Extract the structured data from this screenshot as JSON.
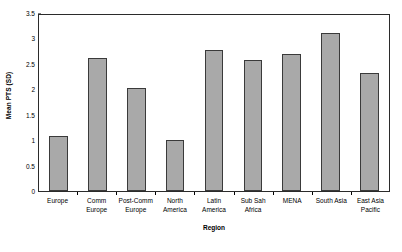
{
  "chart_data": {
    "type": "bar",
    "title": "",
    "subtitle": "",
    "xlabel": "Region",
    "ylabel": "Mean PTS (SD)",
    "categories": [
      "Europe",
      "Comm Europe",
      "Post-Comm Europe",
      "North America",
      "Latin America",
      "Sub Sah Africa",
      "MENA",
      "South Asia",
      "East Asia Pacific"
    ],
    "category_label_lines": [
      "Europe",
      "Comm\nEurope",
      "Post-Comm\nEurope",
      "North\nAmerica",
      "Latin\nAmerica",
      "Sub Sah\nAfrica",
      "MENA",
      "South Asia",
      "East Asia\nPacific"
    ],
    "values": [
      1.09,
      2.62,
      2.02,
      1.0,
      2.77,
      2.57,
      2.7,
      3.11,
      2.33
    ],
    "ylim": [
      0,
      3.5
    ],
    "ytick_values": [
      0,
      0.5,
      1,
      1.5,
      2,
      2.5,
      3,
      3.5
    ],
    "ytick_labels": [
      "0",
      "0.5",
      "1",
      "1.5",
      "2",
      "2.5",
      "3",
      "3.5"
    ],
    "grid": false,
    "legend": "none",
    "bar_color": "#a9a9a9",
    "bar_border_color": "#3a3a3a",
    "axis_color": "#2b2b2b",
    "background_color": "#ffffff"
  }
}
